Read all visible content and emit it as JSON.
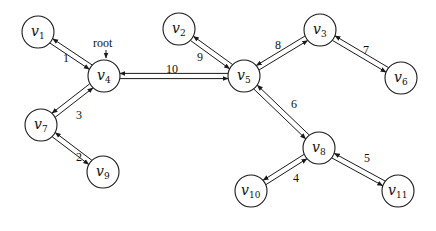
{
  "diagram": {
    "type": "tree-graph",
    "root_label": "root",
    "root_node": "v4",
    "node_radius": 16,
    "nodes": [
      {
        "id": "v1",
        "base": "v",
        "sub": "1",
        "x": 38,
        "y": 32
      },
      {
        "id": "v2",
        "base": "v",
        "sub": "2",
        "x": 179,
        "y": 29
      },
      {
        "id": "v3",
        "base": "v",
        "sub": "3",
        "x": 320,
        "y": 30
      },
      {
        "id": "v4",
        "base": "v",
        "sub": "4",
        "x": 104,
        "y": 76
      },
      {
        "id": "v5",
        "base": "v",
        "sub": "5",
        "x": 244,
        "y": 76
      },
      {
        "id": "v6",
        "base": "v",
        "sub": "6",
        "x": 401,
        "y": 78
      },
      {
        "id": "v7",
        "base": "v",
        "sub": "7",
        "x": 41,
        "y": 125
      },
      {
        "id": "v8",
        "base": "v",
        "sub": "8",
        "x": 319,
        "y": 148
      },
      {
        "id": "v9",
        "base": "v",
        "sub": "9",
        "x": 103,
        "y": 172
      },
      {
        "id": "v10",
        "base": "v",
        "sub": "10",
        "x": 251,
        "y": 191
      },
      {
        "id": "v11",
        "base": "v",
        "sub": "11",
        "x": 398,
        "y": 191
      }
    ],
    "edges": [
      {
        "from": "v4",
        "to": "v1",
        "weight": "1",
        "lx": 66,
        "ly": 62
      },
      {
        "from": "v7",
        "to": "v9",
        "weight": "2",
        "lx": 79,
        "ly": 161
      },
      {
        "from": "v4",
        "to": "v7",
        "weight": "3",
        "lx": 79,
        "ly": 119
      },
      {
        "from": "v8",
        "to": "v10",
        "weight": "4",
        "lx": 296,
        "ly": 182
      },
      {
        "from": "v8",
        "to": "v11",
        "weight": "5",
        "lx": 367,
        "ly": 162
      },
      {
        "from": "v5",
        "to": "v8",
        "weight": "6",
        "lx": 294,
        "ly": 108
      },
      {
        "from": "v3",
        "to": "v6",
        "weight": "7",
        "lx": 366,
        "ly": 54
      },
      {
        "from": "v5",
        "to": "v3",
        "weight": "8",
        "lx": 278,
        "ly": 49
      },
      {
        "from": "v5",
        "to": "v2",
        "weight": "9",
        "lx": 200,
        "ly": 61
      },
      {
        "from": "v4",
        "to": "v5",
        "weight": "10",
        "lx": 172,
        "ly": 73
      }
    ]
  }
}
